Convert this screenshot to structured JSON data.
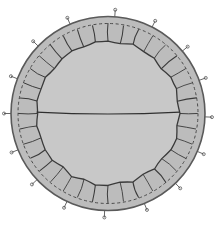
{
  "figure": {
    "canvas": {
      "width": 217,
      "height": 229
    },
    "background_color": "#ffffff"
  },
  "geometry": {
    "center": {
      "x": 108,
      "y": 113.5
    },
    "outer_radius": 97,
    "dashed_radius": 90,
    "inner_radius": 71.5,
    "pin_length": 7
  },
  "colors": {
    "background": "#ffffff",
    "cortex_fill": "#bcbcbc",
    "core_fill": "#c8c8c8",
    "outline": "#5a5a5a",
    "dashed_stroke": "#4a4a4a",
    "septum_stroke": "#3a3a3a",
    "equator_stroke": "#303030",
    "pin_stroke": "#555555"
  },
  "structures": {
    "outer_wall": {
      "label": "outer wall",
      "stroke_width": 1.6,
      "shape": "circle"
    },
    "dashed_ring": {
      "label": "dashed inner boundary",
      "stroke_width": 1.0,
      "dash_pattern": "3 2.6"
    },
    "core_body": {
      "label": "central body",
      "stroke_width": 1.3
    },
    "equator_line": {
      "label": "equatorial division line",
      "stroke_width": 1.2,
      "bow": 4
    }
  },
  "chart_data": {
    "type": "scatter",
    "xlabel": "",
    "ylabel": "",
    "grid": false,
    "legend": "none",
    "segment_count": 36,
    "pin_count": 16,
    "segment_angles_deg": [
      0,
      10,
      20,
      30,
      40,
      50,
      60,
      70,
      80,
      90,
      100,
      110,
      120,
      130,
      140,
      150,
      160,
      170,
      180,
      190,
      200,
      210,
      220,
      230,
      240,
      250,
      260,
      270,
      280,
      290,
      300,
      310,
      320,
      330,
      340,
      350
    ],
    "segment_inner_jitter": [
      0.4,
      -0.8,
      1.2,
      -0.5,
      0.9,
      -1.1,
      0.6,
      1.0,
      -0.7,
      0.3,
      -1.2,
      0.8,
      0.5,
      -0.9,
      1.1,
      -0.4,
      0.7,
      -1.0,
      0.2,
      0.9,
      -0.6,
      1.2,
      -0.8,
      0.4,
      1.0,
      -0.5,
      0.6,
      -1.1,
      0.8,
      -0.3,
      1.1,
      -0.7,
      0.5,
      0.9,
      -1.0,
      0.3
    ],
    "pin_angles_deg": [
      4,
      27,
      50,
      70,
      92,
      113,
      136,
      158,
      182,
      205,
      227,
      248,
      270,
      291,
      314,
      337
    ]
  }
}
